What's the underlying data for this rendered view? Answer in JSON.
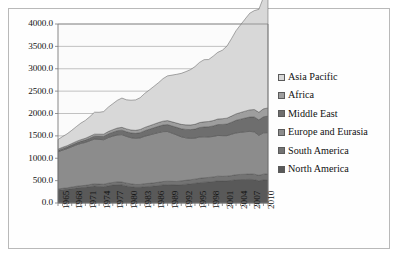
{
  "chart_data": {
    "type": "area",
    "stacked": true,
    "title": "",
    "xlabel": "",
    "ylabel": "",
    "ylim": [
      0,
      4000
    ],
    "ytick_step": 500,
    "ytick_labels": [
      "0.0",
      "500.0",
      "1000.0",
      "1500.0",
      "2000.0",
      "2500.0",
      "3000.0",
      "3500.0",
      "4000.0"
    ],
    "grid": "horizontal",
    "legend_position": "right",
    "x": [
      1965,
      1966,
      1967,
      1968,
      1969,
      1970,
      1971,
      1972,
      1973,
      1974,
      1975,
      1976,
      1977,
      1978,
      1979,
      1980,
      1981,
      1982,
      1983,
      1984,
      1985,
      1986,
      1987,
      1988,
      1989,
      1990,
      1991,
      1992,
      1993,
      1994,
      1995,
      1996,
      1997,
      1998,
      1999,
      2000,
      2001,
      2002,
      2003,
      2004,
      2005,
      2006,
      2007,
      2008,
      2009,
      2010,
      2011
    ],
    "xtick_labels": [
      "1965",
      "1968",
      "1971",
      "1974",
      "1977",
      "1980",
      "1983",
      "1986",
      "1989",
      "1992",
      "1995",
      "1998",
      "2001",
      "2004",
      "2007",
      "2010"
    ],
    "xtick_label_interval": 3,
    "series": [
      {
        "name": "North America",
        "color": "#595959",
        "values": [
          285,
          295,
          305,
          320,
          335,
          345,
          350,
          365,
          380,
          370,
          365,
          385,
          400,
          410,
          405,
          380,
          365,
          350,
          350,
          365,
          370,
          380,
          390,
          405,
          410,
          405,
          400,
          410,
          420,
          430,
          440,
          455,
          465,
          470,
          480,
          495,
          490,
          495,
          505,
          520,
          525,
          525,
          530,
          520,
          495,
          515,
          520
        ]
      },
      {
        "name": "South America",
        "color": "#737373",
        "values": [
          30,
          32,
          34,
          36,
          38,
          41,
          44,
          47,
          50,
          52,
          54,
          57,
          59,
          61,
          63,
          64,
          64,
          64,
          65,
          67,
          69,
          71,
          73,
          75,
          77,
          79,
          81,
          84,
          87,
          90,
          93,
          96,
          99,
          101,
          102,
          105,
          105,
          105,
          107,
          111,
          114,
          117,
          121,
          124,
          123,
          129,
          132
        ]
      },
      {
        "name": "Europe and Eurasia",
        "color": "#8c8c8c",
        "values": [
          830,
          855,
          875,
          900,
          925,
          945,
          960,
          980,
          1000,
          1000,
          995,
          1020,
          1035,
          1050,
          1060,
          1045,
          1030,
          1030,
          1040,
          1060,
          1080,
          1095,
          1110,
          1115,
          1110,
          1075,
          1040,
          985,
          950,
          925,
          915,
          925,
          915,
          905,
          905,
          910,
          910,
          905,
          925,
          935,
          940,
          950,
          950,
          945,
          895,
          925,
          920
        ]
      },
      {
        "name": "Middle East",
        "color": "#6e6e6e",
        "values": [
          30,
          33,
          36,
          39,
          43,
          47,
          52,
          57,
          63,
          68,
          74,
          81,
          88,
          95,
          100,
          103,
          107,
          112,
          117,
          123,
          129,
          135,
          141,
          148,
          155,
          162,
          170,
          180,
          188,
          195,
          203,
          211,
          220,
          228,
          235,
          243,
          251,
          259,
          268,
          282,
          295,
          307,
          320,
          334,
          345,
          358,
          370
        ]
      },
      {
        "name": "Africa",
        "color": "#9e9e9e",
        "values": [
          28,
          30,
          31,
          33,
          35,
          37,
          40,
          43,
          46,
          48,
          50,
          53,
          56,
          59,
          62,
          64,
          66,
          68,
          71,
          74,
          77,
          80,
          83,
          86,
          89,
          92,
          95,
          98,
          101,
          104,
          107,
          110,
          114,
          117,
          120,
          124,
          128,
          132,
          137,
          143,
          149,
          154,
          160,
          166,
          170,
          177,
          183
        ]
      },
      {
        "name": "Asia Pacific",
        "color": "#d8d8d8",
        "values": [
          215,
          240,
          265,
          295,
          330,
          370,
          400,
          440,
          490,
          490,
          505,
          545,
          580,
          620,
          655,
          650,
          665,
          680,
          710,
          760,
          800,
          845,
          890,
          950,
          1000,
          1045,
          1090,
          1140,
          1190,
          1235,
          1290,
          1345,
          1390,
          1385,
          1440,
          1490,
          1530,
          1610,
          1730,
          1860,
          1960,
          2060,
          2160,
          2210,
          2300,
          2490,
          2580
        ]
      }
    ],
    "legend_entries": [
      {
        "label": "Asia Pacific",
        "color": "#d8d8d8"
      },
      {
        "label": "Africa",
        "color": "#9e9e9e"
      },
      {
        "label": "Middle East",
        "color": "#6e6e6e"
      },
      {
        "label": "Europe and Eurasia",
        "color": "#8c8c8c"
      },
      {
        "label": "South America",
        "color": "#737373"
      },
      {
        "label": "North America",
        "color": "#595959"
      }
    ]
  },
  "plot": {
    "left": 58,
    "top": 24,
    "right": 268,
    "bottom": 203,
    "bg": "#fbfbfb",
    "grid_color": "#9a9a9a",
    "axis_color": "#7a7a7a",
    "border_color": "#b9b9b9"
  }
}
